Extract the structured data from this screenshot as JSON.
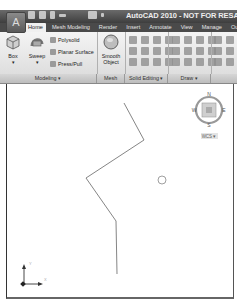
{
  "window": {
    "title": "AutoCAD 2010 - NOT FOR RESALE  Dra",
    "app_button_icon": "autocad-logo-icon",
    "quick_access": [
      "new-icon",
      "open-icon",
      "save-icon",
      "undo-icon",
      "plot-icon",
      "dropdown-icon"
    ]
  },
  "ribbon": {
    "tabs": [
      {
        "label": "Home",
        "active": true
      },
      {
        "label": "Mesh Modeling",
        "active": false
      },
      {
        "label": "Render",
        "active": false
      },
      {
        "label": "Insert",
        "active": false
      },
      {
        "label": "Annotate",
        "active": false
      },
      {
        "label": "View",
        "active": false
      },
      {
        "label": "Manage",
        "active": false
      },
      {
        "label": "Output",
        "active": false
      }
    ],
    "modeling": {
      "box_label": "Box",
      "sweep_label": "Sweep",
      "polysolid_label": "Polysolid",
      "planar_surface_label": "Planar Surface",
      "presspull_label": "Press/Pull"
    },
    "mesh": {
      "smooth_object_label": "Smooth Object"
    },
    "panels": [
      {
        "label": "Modeling ▾"
      },
      {
        "label": "Mesh"
      },
      {
        "label": "Solid Editing ▾"
      },
      {
        "label": "Draw ▾"
      },
      {
        "label": ""
      }
    ]
  },
  "viewcube": {
    "north": "N",
    "south": "S",
    "east": "E",
    "west": "W",
    "wcs_label": "WCS ▾"
  },
  "ucs": {
    "x_label": "X",
    "y_label": "Y"
  },
  "colors": {
    "titlebar": "#4a4a4a",
    "ribbon": "#ececec",
    "drawing_line": "#555555"
  }
}
